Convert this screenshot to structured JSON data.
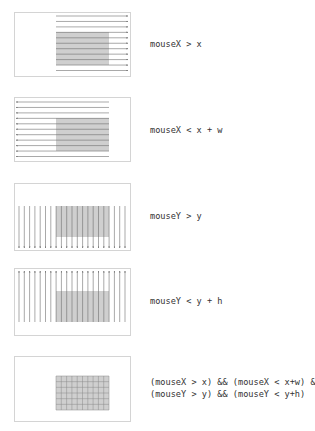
{
  "diagram": {
    "colors": {
      "border": "#d4d4d4",
      "rect_fill": "#cfcfcf",
      "line": "#6f6f6f",
      "text": "#333333"
    },
    "panels": [
      {
        "id": "mousex-gt-x",
        "label": "mouseX > x",
        "direction": "right"
      },
      {
        "id": "mousex-lt-x-plus-w",
        "label": "mouseX < x + w",
        "direction": "left"
      },
      {
        "id": "mousey-gt-y",
        "label": "mouseY > y",
        "direction": "down"
      },
      {
        "id": "mousey-lt-y-plus-h",
        "label": "mouseY < y + h",
        "direction": "up"
      },
      {
        "id": "combined",
        "label_line1": "(mouseX > x) && (mouseX < x+w) &&",
        "label_line2": "(mouseY > y) && (mouseY < y+h)",
        "direction": "grid"
      }
    ]
  }
}
